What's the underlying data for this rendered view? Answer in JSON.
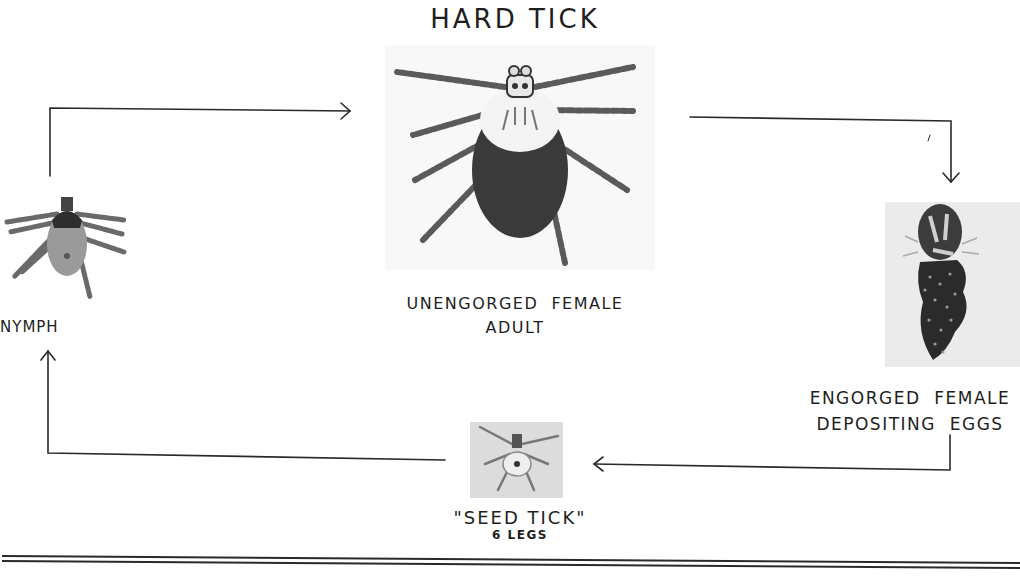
{
  "diagram": {
    "title": "HARD TICK",
    "type": "life-cycle",
    "stages": [
      {
        "id": "adult",
        "label_line1": "UNENGORGED  FEMALE",
        "label_line2": "ADULT"
      },
      {
        "id": "engorged",
        "label_line1": "ENGORGED  FEMALE",
        "label_line2": "DEPOSITING  EGGS"
      },
      {
        "id": "seed",
        "label_line1": "\"SEED TICK\"",
        "label_line2": "6 LEGS"
      },
      {
        "id": "nymph",
        "label_line1": "NYMPH"
      }
    ],
    "flow": [
      {
        "from": "nymph",
        "to": "adult"
      },
      {
        "from": "adult",
        "to": "engorged"
      },
      {
        "from": "engorged",
        "to": "seed"
      },
      {
        "from": "seed",
        "to": "nymph"
      }
    ],
    "colors": {
      "ink": "#1e1e1e",
      "tick_body_dark": "#3a3a3a",
      "photo_bg": "#e6e6e6",
      "background": "#ffffff"
    }
  }
}
